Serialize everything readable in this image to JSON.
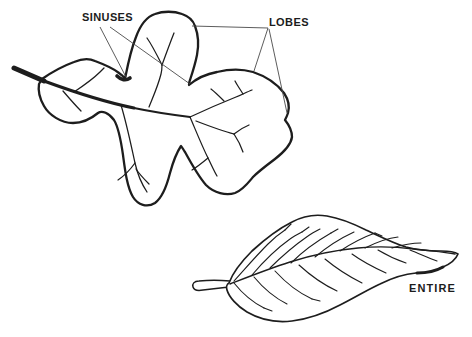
{
  "figure": {
    "type": "botanical-line-drawing",
    "background_color": "#ffffff",
    "ink_color": "#1d1d1d",
    "pointer_line_color": "#4a4a4a"
  },
  "labels": {
    "sinuses": "SINUSES",
    "lobes": "LOBES",
    "entire": "ENTIRE"
  },
  "leaves": [
    {
      "id": "lobed-leaf",
      "margin_type": "lobed",
      "annotations": [
        "SINUSES",
        "LOBES"
      ]
    },
    {
      "id": "entire-leaf",
      "margin_type": "entire",
      "annotations": [
        "ENTIRE"
      ]
    }
  ]
}
